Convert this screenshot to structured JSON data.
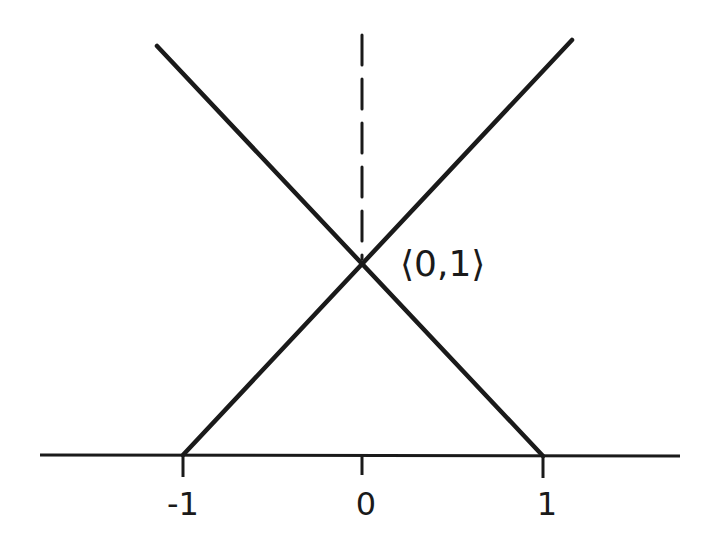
{
  "diagram": {
    "type": "function-graph",
    "colors": {
      "stroke": "#1a1a1a",
      "background": "#ffffff"
    },
    "axis": {
      "ticks": [
        {
          "value": -1,
          "label": "-1"
        },
        {
          "value": 0,
          "label": "0"
        },
        {
          "value": 1,
          "label": "1"
        }
      ]
    },
    "lines": [
      {
        "name": "rising-line",
        "from": [
          -1,
          0
        ],
        "to_direction": "up-right",
        "passes_through": [
          0,
          1
        ]
      },
      {
        "name": "falling-line",
        "from": [
          1,
          0
        ],
        "to_direction": "up-left",
        "passes_through": [
          0,
          1
        ]
      }
    ],
    "dashed_line": {
      "x": 0,
      "style": "dashed"
    },
    "intersection": {
      "point": [
        0,
        1
      ],
      "label": "⟨0,1⟩"
    }
  }
}
